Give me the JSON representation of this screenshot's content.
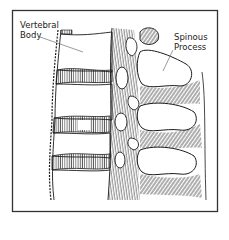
{
  "figure": {
    "type": "anatomical line illustration",
    "labels": {
      "vertebral_body": {
        "line1": "Vertebral",
        "line2": "Body"
      },
      "spinous_process": {
        "line1": "Spinous",
        "line2": "Process"
      }
    },
    "colors": {
      "ink": "#1a1a1a",
      "paper": "#ffffff",
      "frame": "#333333"
    }
  }
}
